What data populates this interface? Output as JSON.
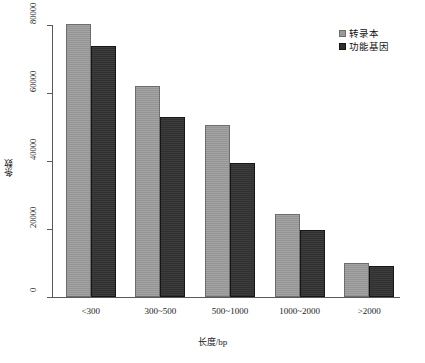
{
  "chart_data": {
    "type": "bar",
    "title": "",
    "subtitle": "",
    "xlabel": "长度/bp",
    "ylabel": "条数",
    "categories": [
      "<300",
      "300~500",
      "500~1000",
      "1000~2000",
      ">2000"
    ],
    "series": [
      {
        "name": "转录本",
        "color": "#9a9a9a",
        "values": [
          80200,
          62200,
          50500,
          24400,
          9900
        ]
      },
      {
        "name": "功能基因",
        "color": "#333333",
        "values": [
          73700,
          53000,
          39500,
          19700,
          9000
        ]
      }
    ],
    "ylim": [
      0,
      84000
    ],
    "yticks": [
      0,
      20000,
      40000,
      60000,
      80000
    ],
    "ytick_labels": [
      "0",
      "20000",
      "40000",
      "60000",
      "80000"
    ],
    "grid": false,
    "legend_position": "top-right",
    "bar_group_layout": "grouped"
  },
  "axes": {
    "y_label": "条数",
    "x_label": "长度/bp"
  },
  "legend": {
    "entries": [
      {
        "label": "转录本",
        "swatch": "legend-swatch-transcript"
      },
      {
        "label": "功能基因",
        "swatch": "legend-swatch-gene"
      }
    ]
  }
}
